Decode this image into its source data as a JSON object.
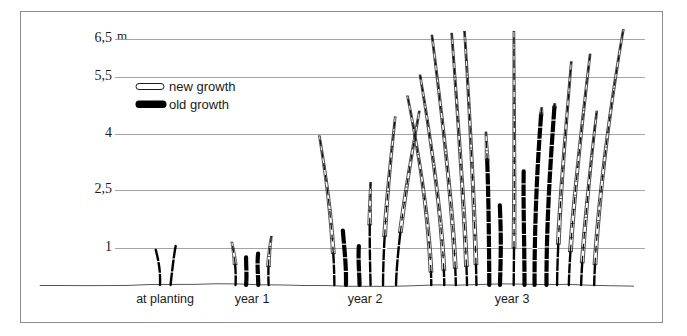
{
  "chart_data": {
    "type": "line",
    "title": "",
    "xlabel": "",
    "ylabel": "m",
    "unit": "m",
    "grid": true,
    "legend_position": "upper-left-inside",
    "ylim": [
      0,
      7
    ],
    "yticks": [
      1,
      2.5,
      4,
      5.5,
      6.5
    ],
    "ytick_labels": [
      "1",
      "2,5",
      "4",
      "5,5",
      "6,5"
    ],
    "categories": [
      "at planting",
      "year 1",
      "year 2",
      "year 3"
    ],
    "legend": [
      {
        "key": "new_growth",
        "label": "new growth",
        "style": "hollow-outline",
        "color": "#ffffff",
        "stroke": "#1a1a1a"
      },
      {
        "key": "old_growth",
        "label": "old growth",
        "style": "solid-fill",
        "color": "#000000",
        "stroke": "#000000"
      }
    ],
    "series": [
      {
        "name": "at planting",
        "x_center": 165,
        "stem_count": 2,
        "stems": [
          {
            "height_m": 0.95,
            "old_growth_m": 0.95,
            "new_growth_m": 0.0,
            "thick": false
          },
          {
            "height_m": 1.05,
            "old_growth_m": 1.05,
            "new_growth_m": 0.0,
            "thick": false
          }
        ]
      },
      {
        "name": "year 1",
        "x_center": 252,
        "stem_count": 4,
        "stems": [
          {
            "height_m": 1.15,
            "old_growth_m": 0.55,
            "new_growth_m": 0.6,
            "thick": false
          },
          {
            "height_m": 0.75,
            "old_growth_m": 0.75,
            "new_growth_m": 0.0,
            "thick": true
          },
          {
            "height_m": 0.85,
            "old_growth_m": 0.85,
            "new_growth_m": 0.0,
            "thick": true
          },
          {
            "height_m": 1.3,
            "old_growth_m": 0.5,
            "new_growth_m": 0.8,
            "thick": false
          }
        ]
      },
      {
        "name": "year 2",
        "x_center": 365,
        "stem_count": 6,
        "stems": [
          {
            "height_m": 3.95,
            "old_growth_m": 0.85,
            "new_growth_m": 3.1,
            "thick": false
          },
          {
            "height_m": 1.45,
            "old_growth_m": 1.45,
            "new_growth_m": 0.0,
            "thick": true
          },
          {
            "height_m": 1.05,
            "old_growth_m": 1.05,
            "new_growth_m": 0.0,
            "thick": true
          },
          {
            "height_m": 2.7,
            "old_growth_m": 1.6,
            "new_growth_m": 1.1,
            "thick": false
          },
          {
            "height_m": 4.45,
            "old_growth_m": 1.3,
            "new_growth_m": 3.15,
            "thick": false
          },
          {
            "height_m": 4.6,
            "old_growth_m": 1.4,
            "new_growth_m": 3.2,
            "thick": false
          }
        ]
      },
      {
        "name": "year 3",
        "x_center": 512,
        "stem_count": 15,
        "stems": [
          {
            "height_m": 5.0,
            "old_growth_m": 0.35,
            "new_growth_m": 4.65,
            "thick": false
          },
          {
            "height_m": 5.55,
            "old_growth_m": 0.4,
            "new_growth_m": 5.15,
            "thick": false
          },
          {
            "height_m": 6.6,
            "old_growth_m": 0.45,
            "new_growth_m": 6.15,
            "thick": false
          },
          {
            "height_m": 6.65,
            "old_growth_m": 0.5,
            "new_growth_m": 6.15,
            "thick": false
          },
          {
            "height_m": 6.7,
            "old_growth_m": 0.55,
            "new_growth_m": 6.15,
            "thick": false
          },
          {
            "height_m": 4.05,
            "old_growth_m": 3.3,
            "new_growth_m": 0.75,
            "thick": true
          },
          {
            "height_m": 2.1,
            "old_growth_m": 2.1,
            "new_growth_m": 0.0,
            "thick": true
          },
          {
            "height_m": 6.7,
            "old_growth_m": 1.0,
            "new_growth_m": 5.7,
            "thick": false
          },
          {
            "height_m": 3.0,
            "old_growth_m": 3.0,
            "new_growth_m": 0.0,
            "thick": true
          },
          {
            "height_m": 4.7,
            "old_growth_m": 4.5,
            "new_growth_m": 0.2,
            "thick": true
          },
          {
            "height_m": 4.8,
            "old_growth_m": 4.7,
            "new_growth_m": 0.1,
            "thick": true
          },
          {
            "height_m": 5.9,
            "old_growth_m": 1.1,
            "new_growth_m": 4.8,
            "thick": false
          },
          {
            "height_m": 6.1,
            "old_growth_m": 0.9,
            "new_growth_m": 5.2,
            "thick": false
          },
          {
            "height_m": 4.6,
            "old_growth_m": 0.6,
            "new_growth_m": 4.0,
            "thick": false
          },
          {
            "height_m": 6.75,
            "old_growth_m": 0.55,
            "new_growth_m": 6.2,
            "thick": false
          }
        ]
      }
    ]
  },
  "axis": {
    "unit_label": "m",
    "ytick_labels": [
      "6,5",
      "5,5",
      "4",
      "2,5",
      "1"
    ],
    "xtick_labels": [
      "at planting",
      "year 1",
      "year 2",
      "year 3"
    ]
  },
  "legend": {
    "new_growth_label": "new growth",
    "old_growth_label": "old growth"
  },
  "colors": {
    "gridline": "#9a9a9a",
    "groundline": "#555555",
    "old_growth": "#000000",
    "new_growth_stroke": "#2a2a2a",
    "frame": "#8d8d8d",
    "background": "#ffffff"
  }
}
